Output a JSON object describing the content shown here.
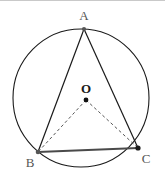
{
  "figure": {
    "background_color": "#ffffff",
    "top_rule_color": "#c9c9c9",
    "stroke_color": "#1a1a1a",
    "dashed_color": "#555555",
    "thick_chord_color": "#4a4a4a",
    "labels": {
      "vertex_a": "A",
      "vertex_b": "B",
      "vertex_c": "C",
      "center_o": "O"
    },
    "geometry": {
      "circle": {
        "cx": 81,
        "cy": 98,
        "r": 69
      },
      "points": {
        "A": {
          "x": 84,
          "y": 29
        },
        "B": {
          "x": 38,
          "y": 152
        },
        "C": {
          "x": 138,
          "y": 148
        },
        "O": {
          "x": 86,
          "y": 100
        }
      },
      "solid_segments": [
        "A-B",
        "A-C"
      ],
      "thick_segments": [
        "B-C"
      ],
      "dashed_segments": [
        "O-B",
        "O-C"
      ],
      "label_positions": {
        "A": {
          "x": 84,
          "y": 20
        },
        "B": {
          "x": 30,
          "y": 167
        },
        "C": {
          "x": 146,
          "y": 163
        },
        "O": {
          "x": 86,
          "y": 93
        }
      }
    }
  }
}
